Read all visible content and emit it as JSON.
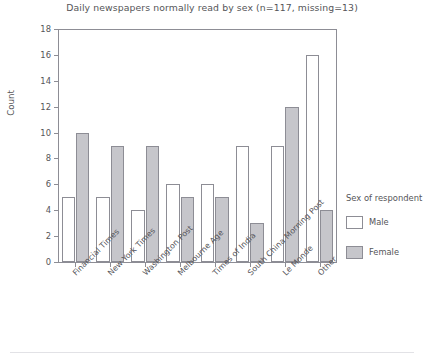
{
  "chart_data": {
    "type": "bar",
    "title": "Daily newspapers normally read by sex (n=117, missing=13)",
    "xlabel": "",
    "ylabel": "Count",
    "ylim": [
      0,
      18
    ],
    "yticks": [
      0,
      2,
      4,
      6,
      8,
      10,
      12,
      14,
      16,
      18
    ],
    "grid": false,
    "legend_position": "right",
    "legend_title": "Sex of respondent",
    "categories": [
      "Financial Times",
      "New York Times",
      "Washington Post",
      "Melbourne Age",
      "Times of India",
      "South China Morning Post",
      "Le Monde",
      "Other"
    ],
    "series": [
      {
        "name": "Male",
        "color": "#ffffff",
        "values": [
          5,
          5,
          4,
          6,
          6,
          9,
          9,
          16
        ]
      },
      {
        "name": "Female",
        "color": "#c6c6cb",
        "values": [
          10,
          9,
          9,
          5,
          5,
          3,
          12,
          4
        ]
      }
    ]
  },
  "axis": {
    "y_label": "Count",
    "y_tick_labels": [
      "0",
      "2",
      "4",
      "6",
      "8",
      "10",
      "12",
      "14",
      "16",
      "18"
    ]
  },
  "legend": {
    "title": "Sex of respondent",
    "items": [
      {
        "label": "Male",
        "swatch": "male"
      },
      {
        "label": "Female",
        "swatch": "female"
      }
    ]
  },
  "colors": {
    "male_fill": "#ffffff",
    "female_fill": "#c6c6cb",
    "bar_stroke": "#8d8d95",
    "axis": "#8d8d95",
    "text": "#555558",
    "background": "#ffffff"
  }
}
